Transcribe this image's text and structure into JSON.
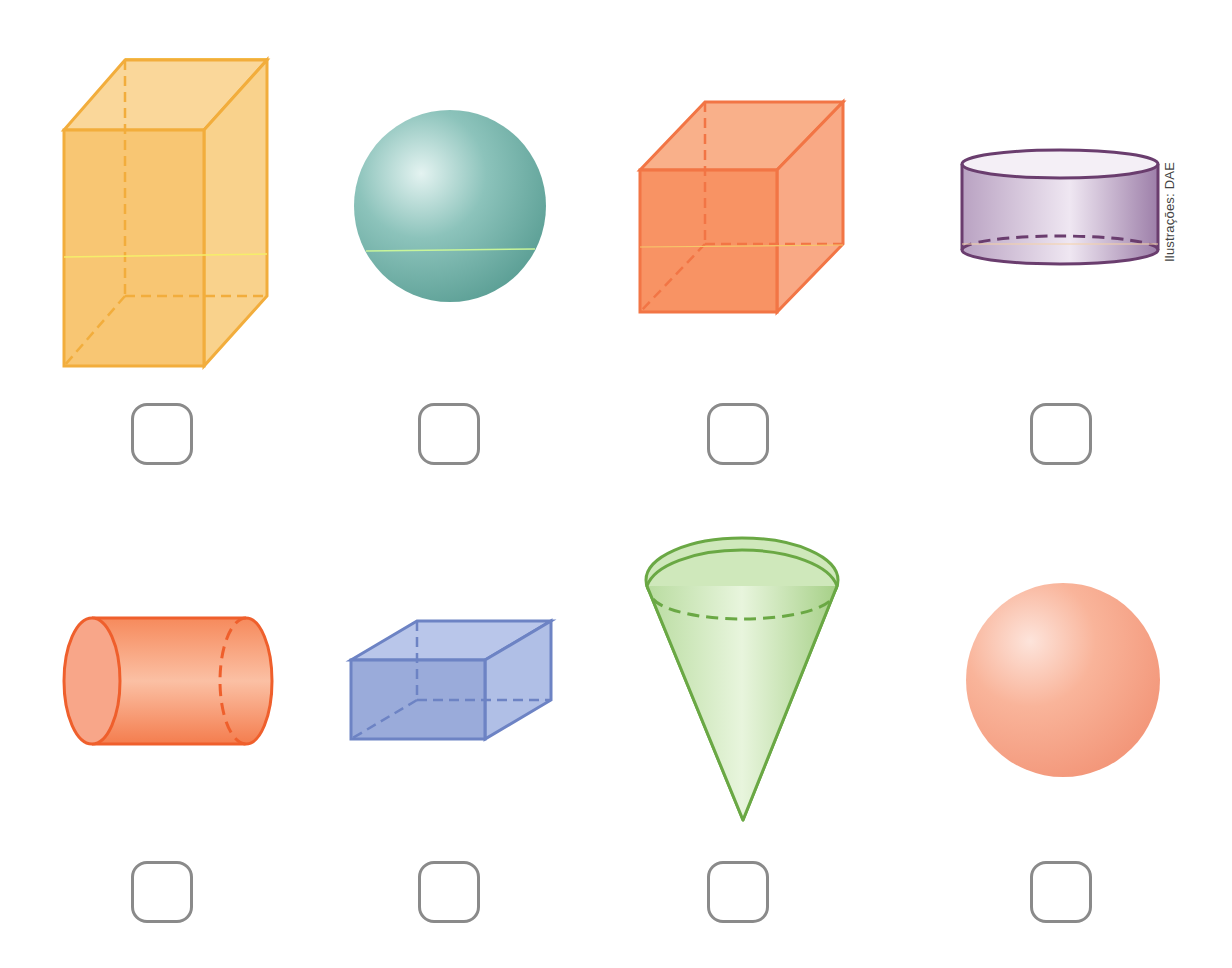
{
  "page": {
    "credit": "Ilustrações: DAE"
  },
  "shapes": [
    {
      "name": "rectangular prism (tall)",
      "color": "#f7b84a"
    },
    {
      "name": "sphere",
      "color": "#6fb3aa"
    },
    {
      "name": "cube",
      "color": "#f7864a"
    },
    {
      "name": "cylinder (short)",
      "color": "#a98bb4"
    },
    {
      "name": "cylinder (horizontal)",
      "color": "#f47a4c"
    },
    {
      "name": "rectangular prism (flat)",
      "color": "#7f96d1"
    },
    {
      "name": "cone",
      "color": "#a8d18a"
    },
    {
      "name": "sphere",
      "color": "#f8a98b"
    }
  ],
  "checkboxes": [
    {
      "checked": false
    },
    {
      "checked": false
    },
    {
      "checked": false
    },
    {
      "checked": false
    },
    {
      "checked": false
    },
    {
      "checked": false
    },
    {
      "checked": false
    },
    {
      "checked": false
    }
  ]
}
